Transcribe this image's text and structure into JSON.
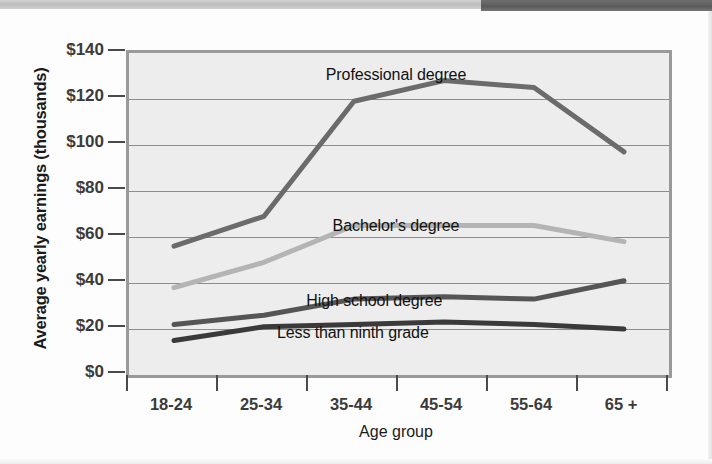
{
  "figure": {
    "y_axis_title": "Average yearly earnings (thousands)",
    "x_axis_title": "Age group"
  },
  "chart_data": {
    "type": "line",
    "title": "",
    "xlabel": "Age group",
    "ylabel": "Average yearly earnings (thousands)",
    "categories": [
      "18-24",
      "25-34",
      "35-44",
      "45-54",
      "55-64",
      "65 +"
    ],
    "ylim": [
      0,
      140
    ],
    "ytick_values": [
      0,
      20,
      40,
      60,
      80,
      100,
      120,
      140
    ],
    "ytick_labels": [
      "$0",
      "$20",
      "$40",
      "$60",
      "$80",
      "$100",
      "$120",
      "$140"
    ],
    "grid": true,
    "legend_position": "inline-labels",
    "series": [
      {
        "name": "Professional degree",
        "color": "#6b6b6b",
        "values": [
          56,
          69,
          119,
          128,
          125,
          97
        ],
        "label_x_pct": 50,
        "label_y_pct": 5
      },
      {
        "name": "Bachelor's degree",
        "color": "#b4b4b4",
        "values": [
          38,
          49,
          65,
          65,
          65,
          58
        ],
        "label_x_pct": 50,
        "label_y_pct": 52
      },
      {
        "name": "High school degree",
        "color": "#555555",
        "values": [
          22,
          26,
          33,
          34,
          33,
          41
        ],
        "label_x_pct": 46,
        "label_y_pct": 75
      },
      {
        "name": "Less than ninth grade",
        "color": "#3a3a3a",
        "values": [
          15,
          21,
          22,
          23,
          22,
          20
        ],
        "label_x_pct": 42,
        "label_y_pct": 85
      }
    ]
  },
  "colors": {
    "plot_background": "#ededed",
    "plot_border": "#9a9a9a",
    "gridline": "#8d8d8d",
    "axis_text": "#3b3b3b",
    "header_bar_light": "#c6c6c6",
    "header_bar_dark": "#5b5b5b"
  }
}
